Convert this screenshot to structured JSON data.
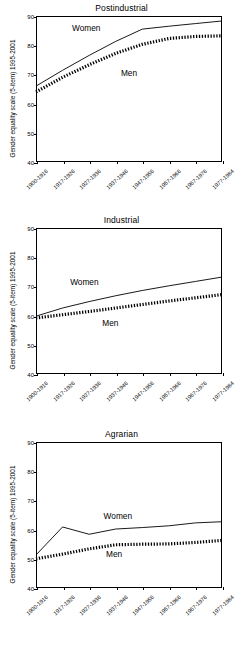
{
  "figure": {
    "ylabel": "Gender equality scale (5-item) 1995-2001",
    "cohorts": [
      "1900-1916",
      "1917-1926",
      "1927-1936",
      "1937-1946",
      "1947-1956",
      "1957-1966",
      "1967-1976",
      "1977-1984"
    ],
    "yticks": [
      40,
      50,
      60,
      70,
      80,
      90
    ],
    "series_labels": {
      "women": "Women",
      "men": "Men"
    },
    "colors": {
      "line": "#000000",
      "background": "#ffffff"
    }
  },
  "chart_data": [
    {
      "type": "line",
      "title": "Postindustrial",
      "xlabel": "",
      "ylabel": "Gender equality scale (5-item) 1995-2001",
      "categories": [
        "1900-1916",
        "1917-1926",
        "1927-1936",
        "1937-1946",
        "1947-1956",
        "1957-1966",
        "1967-1976",
        "1977-1984"
      ],
      "ylim": [
        40,
        90
      ],
      "grid": false,
      "legend": "inline-annotation",
      "series": [
        {
          "name": "Women",
          "style": "solid",
          "values": [
            66.0,
            71.4,
            76.5,
            81.3,
            85.5,
            86.5,
            87.4,
            88.3
          ]
        },
        {
          "name": "Men",
          "style": "dotted",
          "values": [
            64.0,
            69.0,
            73.3,
            77.2,
            80.3,
            82.3,
            83.0,
            83.2
          ]
        }
      ]
    },
    {
      "type": "line",
      "title": "Industrial",
      "xlabel": "",
      "ylabel": "Gender equality scale (5-item) 1995-2001",
      "categories": [
        "1900-1916",
        "1917-1926",
        "1927-1936",
        "1937-1946",
        "1947-1956",
        "1957-1966",
        "1967-1976",
        "1977-1984"
      ],
      "ylim": [
        40,
        90
      ],
      "grid": false,
      "legend": "inline-annotation",
      "series": [
        {
          "name": "Women",
          "style": "solid",
          "values": [
            59.8,
            62.6,
            64.8,
            66.8,
            68.6,
            70.2,
            71.7,
            73.2
          ]
        },
        {
          "name": "Men",
          "style": "dotted",
          "values": [
            59.2,
            60.3,
            61.4,
            62.6,
            63.8,
            65.0,
            66.1,
            67.2
          ]
        }
      ]
    },
    {
      "type": "line",
      "title": "Agrarian",
      "xlabel": "",
      "ylabel": "Gender equality scale (5-item) 1995-2001",
      "categories": [
        "1900-1916",
        "1917-1926",
        "1927-1936",
        "1937-1946",
        "1947-1956",
        "1957-1966",
        "1967-1976",
        "1977-1984"
      ],
      "ylim": [
        40,
        90
      ],
      "grid": false,
      "legend": "inline-annotation",
      "series": [
        {
          "name": "Women",
          "style": "solid",
          "values": [
            51.3,
            60.9,
            58.4,
            60.2,
            60.7,
            61.3,
            62.3,
            62.7
          ]
        },
        {
          "name": "Men",
          "style": "dotted",
          "values": [
            50.0,
            51.6,
            53.4,
            54.8,
            55.0,
            55.1,
            55.6,
            56.3
          ]
        }
      ]
    }
  ],
  "annotations": [
    {
      "panel": 0,
      "text": "Women",
      "x_frac": 0.27,
      "y_value": 85.8
    },
    {
      "panel": 0,
      "text": "Men",
      "x_frac": 0.5,
      "y_value": 70.5
    },
    {
      "panel": 1,
      "text": "Women",
      "x_frac": 0.26,
      "y_value": 71.5
    },
    {
      "panel": 1,
      "text": "Men",
      "x_frac": 0.4,
      "y_value": 57.5
    },
    {
      "panel": 2,
      "text": "Women",
      "x_frac": 0.44,
      "y_value": 64.5
    },
    {
      "panel": 2,
      "text": "Men",
      "x_frac": 0.42,
      "y_value": 51.5
    }
  ]
}
